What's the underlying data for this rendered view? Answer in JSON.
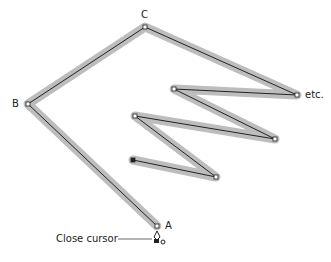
{
  "labels": {
    "a": "A",
    "b": "B",
    "c": "C",
    "etc": "etc.",
    "close_cursor": "Close cursor"
  },
  "path_points": [
    {
      "name": "A",
      "x": 157,
      "y": 226
    },
    {
      "name": "B",
      "x": 28,
      "y": 104
    },
    {
      "name": "C",
      "x": 145,
      "y": 27
    },
    {
      "name": "P4",
      "x": 297,
      "y": 95
    },
    {
      "name": "P5",
      "x": 174,
      "y": 89
    },
    {
      "name": "P6",
      "x": 275,
      "y": 139
    },
    {
      "name": "P7",
      "x": 135,
      "y": 116
    },
    {
      "name": "P8",
      "x": 216,
      "y": 177
    },
    {
      "name": "P9",
      "x": 133,
      "y": 160,
      "filled": true
    }
  ],
  "colors": {
    "highlight": "#bdbdbd",
    "line": "#222222"
  }
}
